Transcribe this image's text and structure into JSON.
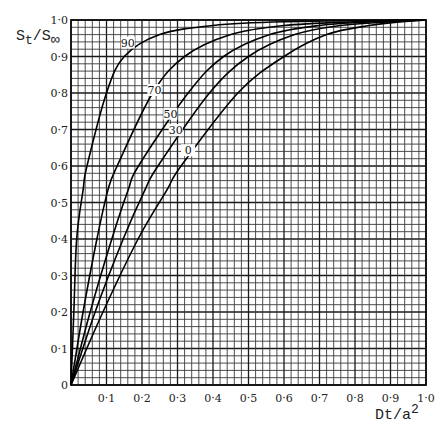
{
  "chart_data": {
    "type": "line",
    "title": "",
    "xlabel": "Dt/a²",
    "ylabel": "Sₜ/S∞",
    "xlim": [
      0,
      1.0
    ],
    "ylim": [
      0,
      1.0
    ],
    "grid": true,
    "grid_minor_step": 0.02,
    "grid_major_step": 0.1,
    "x_ticks": [
      "0·1",
      "0·2",
      "0·3",
      "0·4",
      "0·5",
      "0·6",
      "0·7",
      "0·8",
      "0·9",
      "1·0"
    ],
    "y_ticks": [
      "0",
      "0·1",
      "0·2",
      "0·3",
      "0·4",
      "0·5",
      "0·6",
      "0·7",
      "0·8",
      "0·9",
      "1·0"
    ],
    "legend": "curves labelled inline",
    "series": [
      {
        "name": "90",
        "label": "90",
        "points": [
          [
            0,
            0
          ],
          [
            0.008,
            0.2
          ],
          [
            0.016,
            0.4
          ],
          [
            0.034,
            0.534
          ],
          [
            0.045,
            0.6
          ],
          [
            0.1,
            0.8
          ],
          [
            0.15,
            0.9
          ],
          [
            0.25,
            0.96
          ],
          [
            0.4,
            0.985
          ],
          [
            0.6,
            0.995
          ],
          [
            1.0,
            1.0
          ]
        ]
      },
      {
        "name": "70",
        "label": "70",
        "points": [
          [
            0,
            0
          ],
          [
            0.034,
            0.2
          ],
          [
            0.073,
            0.4
          ],
          [
            0.104,
            0.534
          ],
          [
            0.13,
            0.6
          ],
          [
            0.23,
            0.8
          ],
          [
            0.32,
            0.9
          ],
          [
            0.45,
            0.96
          ],
          [
            0.6,
            0.985
          ],
          [
            0.8,
            0.995
          ],
          [
            1.0,
            1.0
          ]
        ]
      },
      {
        "name": "50",
        "label": "50",
        "points": [
          [
            0,
            0
          ],
          [
            0.054,
            0.2
          ],
          [
            0.115,
            0.4
          ],
          [
            0.161,
            0.534
          ],
          [
            0.19,
            0.6
          ],
          [
            0.33,
            0.8
          ],
          [
            0.43,
            0.9
          ],
          [
            0.56,
            0.96
          ],
          [
            0.7,
            0.985
          ],
          [
            0.85,
            0.995
          ],
          [
            1.0,
            1.0
          ]
        ]
      },
      {
        "name": "30",
        "label": "30",
        "points": [
          [
            0,
            0
          ],
          [
            0.068,
            0.2
          ],
          [
            0.147,
            0.4
          ],
          [
            0.208,
            0.534
          ],
          [
            0.245,
            0.6
          ],
          [
            0.39,
            0.8
          ],
          [
            0.5,
            0.9
          ],
          [
            0.63,
            0.96
          ],
          [
            0.76,
            0.985
          ],
          [
            0.9,
            0.995
          ],
          [
            1.0,
            1.0
          ]
        ]
      },
      {
        "name": "0",
        "label": "0",
        "points": [
          [
            0,
            0
          ],
          [
            0.09,
            0.2
          ],
          [
            0.189,
            0.4
          ],
          [
            0.27,
            0.534
          ],
          [
            0.31,
            0.6
          ],
          [
            0.47,
            0.8
          ],
          [
            0.6,
            0.9
          ],
          [
            0.72,
            0.96
          ],
          [
            0.84,
            0.985
          ],
          [
            0.95,
            0.997
          ],
          [
            1.0,
            1.0
          ]
        ]
      }
    ],
    "annotations": [
      {
        "text": "90",
        "x": 0.16,
        "y": 0.93
      },
      {
        "text": "70",
        "x": 0.235,
        "y": 0.8
      },
      {
        "text": "50",
        "x": 0.28,
        "y": 0.735
      },
      {
        "text": "30",
        "x": 0.295,
        "y": 0.69
      },
      {
        "text": "0",
        "x": 0.33,
        "y": 0.635
      }
    ]
  },
  "axes": {
    "x_label_main": "Dt/a",
    "x_label_sup": "2",
    "y_label_s1": "S",
    "y_label_sub": "t",
    "y_label_slash": "/S",
    "y_label_inf": "∞",
    "origin": "0"
  }
}
